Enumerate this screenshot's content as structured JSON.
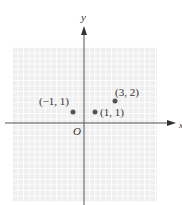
{
  "diagram": {
    "type": "coordinate-plane",
    "axes": {
      "x_label": "x",
      "y_label": "y",
      "origin_label": "O"
    },
    "points": [
      {
        "x": -1,
        "y": 1,
        "label": "(−1, 1)"
      },
      {
        "x": 1,
        "y": 1,
        "label": "(1, 1)"
      },
      {
        "x": 3,
        "y": 2,
        "label": "(3, 2)"
      }
    ],
    "colors": {
      "grid_background": "#efefef",
      "axis": "#555555",
      "point": "#555555",
      "text": "#333333"
    }
  }
}
